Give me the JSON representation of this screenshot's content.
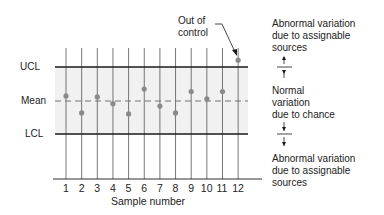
{
  "chart_data": {
    "type": "scatter",
    "title": "",
    "xlabel": "Sample number",
    "ylabel": "",
    "x": [
      1,
      2,
      3,
      4,
      5,
      6,
      7,
      8,
      9,
      10,
      11,
      12
    ],
    "values": [
      0.15,
      -0.35,
      0.12,
      -0.08,
      -0.38,
      0.35,
      -0.15,
      -0.35,
      0.28,
      0.06,
      0.28,
      1.2
    ],
    "reference_lines": {
      "UCL": 1.0,
      "Mean": 0.0,
      "LCL": -1.0
    },
    "ylim": [
      -2.3,
      1.6
    ],
    "grid": "vertical lines at each sample",
    "annotations": [
      "Out of control (sample 12 above UCL)"
    ]
  },
  "labels": {
    "ucl": "UCL",
    "mean": "Mean",
    "lcl": "LCL",
    "xlabel": "Sample number",
    "out_of_control": [
      "Out of",
      "control"
    ],
    "ticks": [
      "1",
      "2",
      "3",
      "4",
      "5",
      "6",
      "7",
      "8",
      "9",
      "10",
      "11",
      "12"
    ]
  },
  "notes": {
    "top": [
      "Abnormal variation",
      "due to assignable",
      "sources"
    ],
    "middle": [
      "Normal",
      "variation",
      "due to chance"
    ],
    "bottom": [
      "Abnormal variation",
      "due to assignable",
      "sources"
    ]
  },
  "colors": {
    "band": "#f1f1f1",
    "line": "#1a1a1a",
    "point": "#8a8a8a",
    "grid": "#555555"
  }
}
